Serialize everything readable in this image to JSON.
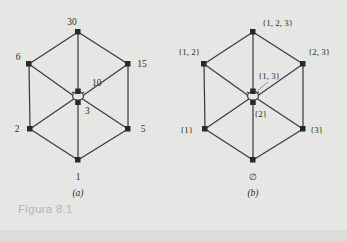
{
  "figure": {
    "caption": "Figura 8.1",
    "sublabel_a": "(a)",
    "sublabel_b": "(b)",
    "colors": {
      "background": "#e9e9e7",
      "edge": "#3a3a3a",
      "node": "#262626",
      "caption": "#b6b6b4"
    }
  },
  "diagram_a": {
    "name": "divisor-lattice-of-30",
    "nodes": {
      "top": "30",
      "upper_left": "6",
      "upper_right": "15",
      "center_upper": "10",
      "center_lower": "3",
      "lower_left": "2",
      "lower_right": "5",
      "bottom": "1"
    }
  },
  "diagram_b": {
    "name": "power-set-lattice-of-123",
    "nodes": {
      "top": "{1, 2, 3}",
      "upper_left": "{1, 2}",
      "upper_right": "{2, 3}",
      "center_upper": "{1, 3}",
      "center_lower": "{2}",
      "lower_left": "{1}",
      "lower_right": "{3}",
      "bottom": "∅"
    }
  }
}
